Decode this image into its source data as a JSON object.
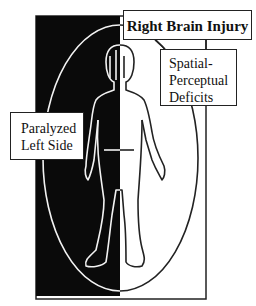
{
  "diagram": {
    "title": "Right Brain Injury",
    "labels": {
      "spatial": [
        "Spatial-",
        "Perceptual",
        "Deficits"
      ],
      "paralyzed": [
        "Paralyzed",
        "Left Side"
      ]
    },
    "colors": {
      "affected_side": "#0a0a0a",
      "unaffected_side": "#ffffff",
      "outline": "#222222"
    },
    "panels": {
      "left": "paralyzed-left-side",
      "right": "unaffected-right-side"
    }
  }
}
